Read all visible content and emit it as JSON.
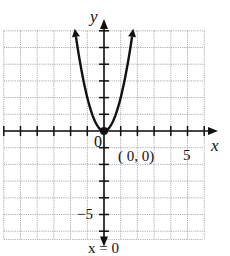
{
  "chart_data": {
    "type": "line",
    "title": "",
    "xlabel": "x",
    "ylabel": "y",
    "xlim": [
      -6,
      6
    ],
    "ylim": [
      -6.5,
      6
    ],
    "grid": true,
    "grid_step": 1,
    "series": [
      {
        "name": "parabola",
        "equation": "y = 2x^2",
        "x": [
          -1.7,
          -1.5,
          -1,
          -0.5,
          0,
          0.5,
          1,
          1.5,
          1.7
        ],
        "values": [
          5.8,
          4.5,
          2,
          0.5,
          0,
          0.5,
          2,
          4.5,
          5.8
        ]
      }
    ],
    "annotations": [
      {
        "text": "(0, 0)",
        "x": 0,
        "y": 0,
        "type": "vertex"
      },
      {
        "text": "x = 0",
        "type": "axis-of-symmetry"
      }
    ],
    "tick_labels": {
      "x": [
        "5"
      ],
      "y": [
        "-5"
      ],
      "origin": "0"
    },
    "colors": {
      "grid": "#9a9a9a",
      "axis": "#111111",
      "curve": "#111111"
    }
  },
  "labels": {
    "top_text": "",
    "x_axis": "x",
    "y_axis": "y",
    "origin": "0",
    "vertex": "( 0, 0)",
    "x_tick_5": "5",
    "y_tick_neg5": "−5",
    "symmetry": "x = 0"
  }
}
